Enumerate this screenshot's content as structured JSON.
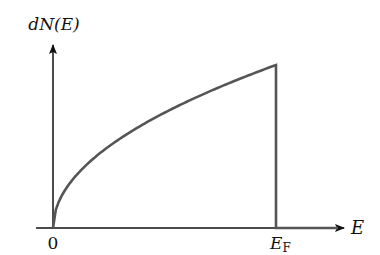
{
  "figure": {
    "y_axis_label": "dN(E)",
    "x_axis_label": "E",
    "origin_label": "0",
    "fermi_label_main": "E",
    "fermi_label_sub": "F"
  },
  "colors": {
    "axis": "#111111",
    "curve": "#555555",
    "background": "#ffffff"
  },
  "chart_data": {
    "type": "line",
    "title": "",
    "xlabel": "E",
    "ylabel": "dN(E)",
    "x_ticks": [
      "0",
      "E_F"
    ],
    "series": [
      {
        "name": "dN(E)",
        "function": "sqrt(E/E_F) for E<=E_F, 0 for E>E_F",
        "x": [
          0,
          0.05,
          0.1,
          0.2,
          0.3,
          0.4,
          0.5,
          0.6,
          0.7,
          0.8,
          0.9,
          1.0,
          1.0,
          1.3
        ],
        "y": [
          0,
          0.224,
          0.316,
          0.447,
          0.548,
          0.632,
          0.707,
          0.775,
          0.837,
          0.894,
          0.949,
          1.0,
          0,
          0
        ]
      }
    ],
    "xlim": [
      0,
      1.3
    ],
    "ylim": [
      0,
      1.13
    ],
    "grid": false,
    "legend": "none"
  }
}
